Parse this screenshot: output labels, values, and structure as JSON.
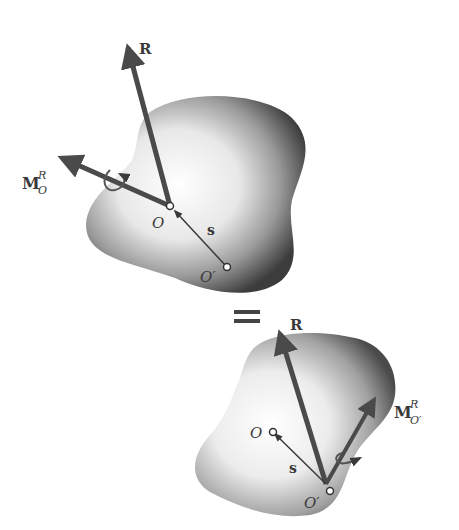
{
  "diagram": {
    "colors": {
      "arrow": "#4a4a4a",
      "body_light": "#ffffff",
      "body_dark": "#3c3c3c",
      "text": "#3a3a3a",
      "equals": "#444444"
    },
    "top_system": {
      "force_label": "R",
      "moment_label_main": "M",
      "moment_label_sup": "R",
      "moment_label_sub": "O",
      "point_o_label": "O",
      "point_o_prime_label": "O′",
      "position_vector_label": "s"
    },
    "equals_sign": "=",
    "bottom_system": {
      "force_label": "R",
      "moment_label_main": "M",
      "moment_label_sup": "R",
      "moment_label_sub": "O′",
      "point_o_label": "O",
      "point_o_prime_label": "O′",
      "position_vector_label": "s"
    }
  }
}
